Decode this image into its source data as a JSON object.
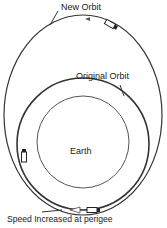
{
  "diagram": {
    "labels": {
      "new_orbit": "New Orbit",
      "original_orbit": "Original Orbit",
      "earth": "Earth",
      "perigee": "Speed Increased at perigee"
    },
    "colors": {
      "line": "#333333",
      "background": "#ffffff"
    }
  }
}
